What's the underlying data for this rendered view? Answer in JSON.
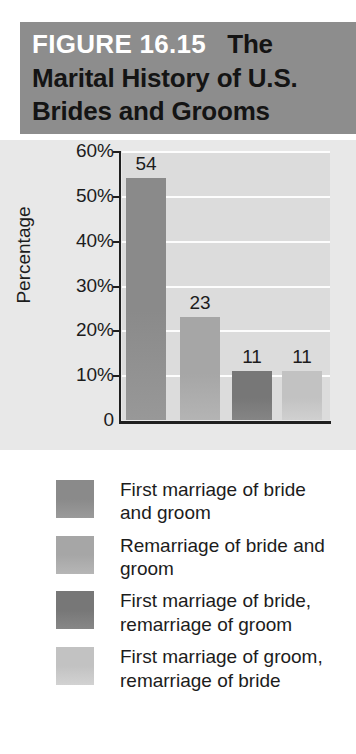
{
  "figure": {
    "number_label": "FIGURE 16.15",
    "title_rest": "The Marital History of U.S. Brides and Grooms",
    "title_full": "FIGURE 16.15   The Marital History of U.S. Brides and Grooms"
  },
  "chart_data": {
    "type": "bar",
    "title": "The Marital History of U.S. Brides and Grooms",
    "xlabel": "",
    "ylabel": "Percentage",
    "ylim": [
      0,
      60
    ],
    "yticks": [
      "0",
      "10%",
      "20%",
      "30%",
      "40%",
      "50%",
      "60%"
    ],
    "ytick_values": [
      0,
      10,
      20,
      30,
      40,
      50,
      60
    ],
    "grid": true,
    "legend_position": "below",
    "categories": [
      "First marriage of bride and groom",
      "Remarriage of bride and groom",
      "First marriage of bride, remarriage of groom",
      "First marriage of groom, remarriage of bride"
    ],
    "values": [
      54,
      23,
      11,
      11
    ],
    "data_labels": [
      "54",
      "23",
      "11",
      "11"
    ],
    "bar_colors": [
      "#8a8a8a",
      "#a6a6a6",
      "#777777",
      "#c2c2c2"
    ],
    "plot_background": "#dcdcdc",
    "gridline_color": "#fdfdfd",
    "axis_color": "#1f1f1f"
  },
  "legend": {
    "items": [
      {
        "label": "First marriage of bride and groom",
        "color": "#8a8a8a"
      },
      {
        "label": "Remarriage of bride and groom",
        "color": "#a6a6a6"
      },
      {
        "label": "First marriage of bride, remarriage of groom",
        "color": "#777777"
      },
      {
        "label": "First marriage of groom, remarriage of bride",
        "color": "#c2c2c2"
      }
    ]
  },
  "colors": {
    "title_band": "#8d8d8d",
    "title_number_text": "#ffffff",
    "title_text": "#141414",
    "page_background": "#e8e8e8"
  }
}
